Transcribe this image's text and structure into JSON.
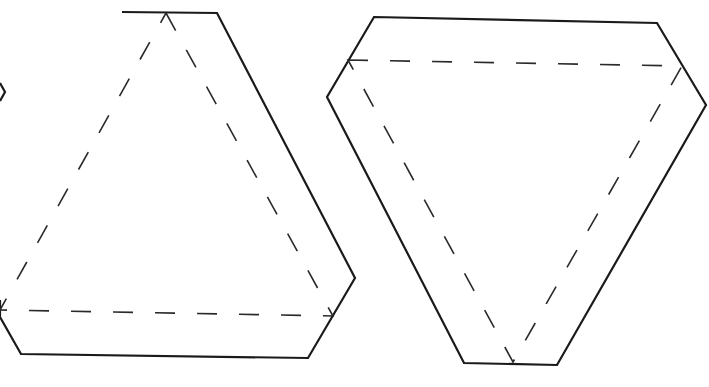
{
  "diagram": {
    "colors": {
      "stroke": "#1a1a1a",
      "background": "#ffffff"
    },
    "shapes": [
      {
        "id": "partial-left-edge",
        "kind": "partial-outline",
        "points": [
          [
            0,
            83
          ],
          [
            5,
            92
          ],
          [
            0,
            101
          ]
        ]
      },
      {
        "id": "hexagon-upright",
        "kind": "outline",
        "points": [
          [
            122,
            12
          ],
          [
            217,
            13
          ],
          [
            355,
            278
          ],
          [
            308,
            358
          ],
          [
            21,
            354
          ],
          [
            0,
            317
          ],
          [
            0,
            300
          ]
        ],
        "fold_triangle": {
          "style": "dashed",
          "points": [
            [
              166,
              13
            ],
            [
              333,
              316
            ],
            [
              0,
              310
            ]
          ]
        }
      },
      {
        "id": "hexagon-inverted",
        "kind": "outline",
        "points": [
          [
            374,
            17
          ],
          [
            657,
            23
          ],
          [
            706,
            105
          ],
          [
            557,
            365
          ],
          [
            464,
            363
          ],
          [
            327,
            97
          ]
        ],
        "fold_triangle": {
          "style": "dashed",
          "points": [
            [
              348,
              60
            ],
            [
              682,
              66
            ],
            [
              513,
              362
            ]
          ]
        }
      }
    ]
  }
}
